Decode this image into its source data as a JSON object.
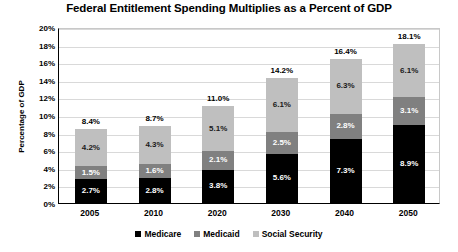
{
  "chart_data": {
    "type": "bar",
    "variant": "stacked-column",
    "title": "Federal Entitlement Spending Multiplies as a Percent of GDP",
    "xlabel": "",
    "ylabel": "Percentage of GDP",
    "ylim": [
      0,
      20
    ],
    "ytick_step": 2,
    "yticks": [
      "20%",
      "18%",
      "16%",
      "14%",
      "12%",
      "10%",
      "8%",
      "6%",
      "4%",
      "2%",
      "0%"
    ],
    "ytick_values": [
      20,
      18,
      16,
      14,
      12,
      10,
      8,
      6,
      4,
      2,
      0
    ],
    "grid": true,
    "grid_axis": "y",
    "legend_position": "bottom",
    "value_format": "percent-one-decimal",
    "categories": [
      "2005",
      "2010",
      "2020",
      "2030",
      "2040",
      "2050"
    ],
    "series": [
      {
        "name": "Medicare",
        "color": "#000000",
        "values": [
          2.7,
          2.8,
          3.8,
          5.6,
          7.3,
          8.9
        ],
        "labels": [
          "2.7%",
          "2.8%",
          "3.8%",
          "5.6%",
          "7.3%",
          "8.9%"
        ]
      },
      {
        "name": "Medicaid",
        "color": "#808080",
        "values": [
          1.5,
          1.6,
          2.1,
          2.5,
          2.8,
          3.1
        ],
        "labels": [
          "1.5%",
          "1.6%",
          "2.1%",
          "2.5%",
          "2.8%",
          "3.1%"
        ]
      },
      {
        "name": "Social Security",
        "color": "#bfbfbf",
        "values": [
          4.2,
          4.3,
          5.1,
          6.1,
          6.3,
          6.1
        ],
        "labels": [
          "4.2%",
          "4.3%",
          "5.1%",
          "6.1%",
          "6.3%",
          "6.1%"
        ]
      }
    ],
    "totals": [
      8.4,
      8.7,
      11.0,
      14.2,
      16.4,
      18.1
    ],
    "total_labels": [
      "8.4%",
      "8.7%",
      "11.0%",
      "14.2%",
      "16.4%",
      "18.1%"
    ]
  },
  "legend": {
    "items": [
      {
        "label": "Medicare",
        "color": "#000000"
      },
      {
        "label": "Medicaid",
        "color": "#808080"
      },
      {
        "label": "Social Security",
        "color": "#bfbfbf"
      }
    ]
  }
}
